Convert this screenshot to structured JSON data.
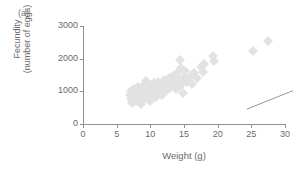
{
  "panel": {
    "label": "(a)"
  },
  "axes": {
    "y_title_line1": "Fecundity",
    "y_title_line2": "(number of eggs)",
    "x_title": "Weight (g)",
    "y_ticks": [
      "0",
      "1000",
      "2000",
      "3000"
    ],
    "x_ticks": [
      "0",
      "5",
      "10",
      "15",
      "20",
      "25",
      "30"
    ]
  },
  "style": {
    "marker_color": "#e2e2e2",
    "line_color": "#8a8a8a",
    "axis_color": "#909090",
    "text_color": "#6a6a6a"
  },
  "chart_data": {
    "type": "scatter",
    "title": "(a)",
    "xlabel": "Weight (g)",
    "ylabel": "Fecundity (number of eggs)",
    "xlim": [
      0,
      30
    ],
    "ylim": [
      0,
      3000
    ],
    "xticks": [
      0,
      5,
      10,
      15,
      20,
      25,
      30
    ],
    "yticks": [
      0,
      1000,
      2000,
      3000
    ],
    "grid": false,
    "legend": "none",
    "marker": "diamond",
    "points": [
      [
        7.0,
        880
      ],
      [
        7.1,
        760
      ],
      [
        7.2,
        1000
      ],
      [
        7.3,
        640
      ],
      [
        7.5,
        900
      ],
      [
        7.6,
        1060
      ],
      [
        7.8,
        700
      ],
      [
        7.9,
        820
      ],
      [
        8.0,
        960
      ],
      [
        8.1,
        1120
      ],
      [
        8.2,
        780
      ],
      [
        8.3,
        880
      ],
      [
        8.5,
        1020
      ],
      [
        8.6,
        620
      ],
      [
        8.8,
        900
      ],
      [
        8.9,
        1080
      ],
      [
        9.0,
        960
      ],
      [
        9.1,
        1180
      ],
      [
        9.2,
        800
      ],
      [
        9.4,
        1320
      ],
      [
        9.5,
        1020
      ],
      [
        9.6,
        880
      ],
      [
        9.8,
        1100
      ],
      [
        9.9,
        700
      ],
      [
        10.0,
        1040
      ],
      [
        10.2,
        1180
      ],
      [
        10.4,
        900
      ],
      [
        10.5,
        1260
      ],
      [
        10.7,
        1000
      ],
      [
        10.9,
        820
      ],
      [
        11.0,
        1140
      ],
      [
        11.1,
        1300
      ],
      [
        11.3,
        960
      ],
      [
        11.5,
        1080
      ],
      [
        11.6,
        1220
      ],
      [
        11.8,
        880
      ],
      [
        12.0,
        1160
      ],
      [
        12.1,
        1340
      ],
      [
        12.3,
        1020
      ],
      [
        12.5,
        1240
      ],
      [
        12.7,
        1420
      ],
      [
        12.9,
        1100
      ],
      [
        13.0,
        1300
      ],
      [
        13.2,
        1180
      ],
      [
        13.4,
        1480
      ],
      [
        13.6,
        1260
      ],
      [
        13.8,
        1060
      ],
      [
        14.0,
        1560
      ],
      [
        14.2,
        1360
      ],
      [
        14.4,
        1960
      ],
      [
        14.5,
        1180
      ],
      [
        14.6,
        1700
      ],
      [
        14.8,
        940
      ],
      [
        15.0,
        1440
      ],
      [
        15.2,
        1620
      ],
      [
        15.5,
        1280
      ],
      [
        16.0,
        1480
      ],
      [
        16.2,
        1220
      ],
      [
        16.5,
        1560
      ],
      [
        17.0,
        1400
      ],
      [
        17.5,
        1760
      ],
      [
        17.8,
        1600
      ],
      [
        18.0,
        1840
      ],
      [
        19.3,
        2080
      ],
      [
        19.5,
        1920
      ],
      [
        25.2,
        2240
      ],
      [
        27.5,
        2540
      ]
    ],
    "trend_line": {
      "x": [
        12.0,
        27.5
      ],
      "y": [
        1250,
        2530
      ]
    }
  }
}
